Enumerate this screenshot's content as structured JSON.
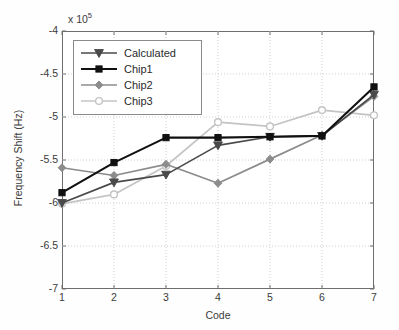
{
  "chart_data": {
    "type": "line",
    "title": "",
    "xlabel": "Code",
    "ylabel": "Frequency Shift (Hz)",
    "exponent_label": "x 10",
    "exponent_power": "5",
    "y_scale_factor": 100000,
    "categories": [
      1,
      2,
      3,
      4,
      5,
      6,
      7
    ],
    "x": [
      1,
      2,
      3,
      4,
      5,
      6,
      7
    ],
    "xlim": [
      1,
      7
    ],
    "ylim": [
      -7,
      -4
    ],
    "xticks": [
      "1",
      "2",
      "3",
      "4",
      "5",
      "6",
      "7"
    ],
    "yticks": [
      "-4",
      "-4.5",
      "-5",
      "-5.5",
      "-6",
      "-6.5",
      "-7"
    ],
    "ytick_values": [
      -4,
      -4.5,
      -5,
      -5.5,
      -6,
      -6.5,
      -7
    ],
    "grid": true,
    "grid_style": "dotted",
    "legend_position": "upper left",
    "series": [
      {
        "name": "Calculated",
        "marker": "triangle-down",
        "color": "#4a4a4a",
        "values": [
          -6.0,
          -5.76,
          -5.67,
          -5.33,
          -5.23,
          -5.22,
          -4.74
        ]
      },
      {
        "name": "Chip1",
        "marker": "square",
        "color": "#111111",
        "values": [
          -5.88,
          -5.53,
          -5.24,
          -5.24,
          -5.23,
          -5.22,
          -4.65
        ]
      },
      {
        "name": "Chip2",
        "marker": "diamond",
        "color": "#8c8c8c",
        "values": [
          -5.59,
          -5.68,
          -5.55,
          -5.77,
          -5.49,
          -5.21,
          -4.76
        ]
      },
      {
        "name": "Chip3",
        "marker": "circle",
        "color": "#c4c4c4",
        "values": [
          -6.01,
          -5.9,
          -5.57,
          -5.06,
          -5.11,
          -4.92,
          -4.98
        ]
      }
    ]
  },
  "legend": {
    "items": [
      {
        "label": "Calculated"
      },
      {
        "label": "Chip1"
      },
      {
        "label": "Chip2"
      },
      {
        "label": "Chip3"
      }
    ]
  }
}
